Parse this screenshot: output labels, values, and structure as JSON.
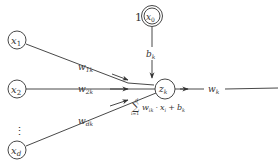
{
  "diagram": {
    "type": "perceptron-neuron",
    "inputs": [
      {
        "id": "x1",
        "var": "x",
        "sub": "1",
        "weight_var": "w",
        "weight_sub": "1k"
      },
      {
        "id": "x2",
        "var": "x",
        "sub": "2",
        "weight_var": "w",
        "weight_sub": "2k"
      },
      {
        "id": "xd",
        "var": "x",
        "sub": "d",
        "weight_var": "w",
        "weight_sub": "dk"
      }
    ],
    "ellipsis": "⋮",
    "bias_node": {
      "constant": "1",
      "var": "x",
      "sub": "0",
      "edge_var": "b",
      "edge_sub": "k"
    },
    "neuron": {
      "var": "z",
      "sub": "k"
    },
    "formula": {
      "sum_symbol": "∑",
      "upper": "d",
      "lower": "i=1",
      "w_var": "w",
      "w_sub": "ik",
      "dot": "·",
      "x_var": "x",
      "x_sub": "i",
      "plus": "+",
      "b_var": "b",
      "b_sub": "k"
    },
    "output": {
      "weight_var": "w",
      "weight_sub": "k"
    },
    "colors": {
      "stroke": "#333333",
      "background": "#ffffff"
    }
  }
}
